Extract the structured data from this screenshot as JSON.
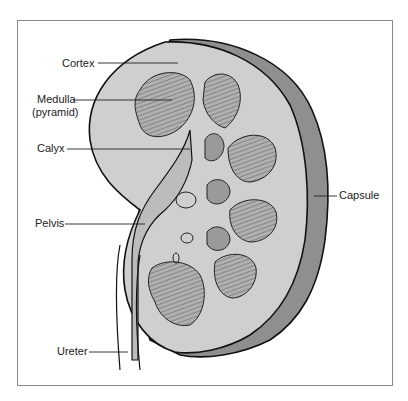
{
  "figure": {
    "labels": {
      "cortex": "Cortex",
      "medulla": "Medulla",
      "medulla_sub": "(pyramid)",
      "calyx": "Calyx",
      "pelvis": "Pelvis",
      "ureter": "Ureter",
      "capsule": "Capsule"
    },
    "colors": {
      "capsule": "#8f8f8f",
      "cortex": "#cfcfcf",
      "pyramid": "#a9a9a9",
      "calyx": "#9a9a9a",
      "outline": "#111111",
      "frame": "#8a8a8a"
    }
  }
}
